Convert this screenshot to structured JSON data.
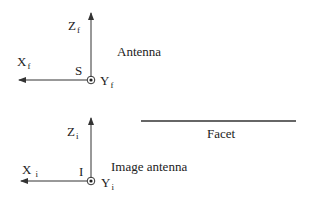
{
  "antenna": {
    "label": "Antenna",
    "origin_label": "S",
    "axes": {
      "z": {
        "main": "Z",
        "sub": "f"
      },
      "x": {
        "main": "X",
        "sub": "f"
      },
      "y": {
        "main": "Y",
        "sub": "f"
      }
    }
  },
  "image_antenna": {
    "label": "Image antenna",
    "origin_label": "I",
    "axes": {
      "z": {
        "main": "Z",
        "sub": "i"
      },
      "x": {
        "main": "X",
        "sub": "i"
      },
      "y": {
        "main": "Y",
        "sub": "i"
      }
    }
  },
  "facet": {
    "label": "Facet"
  },
  "colors": {
    "line": "#333333",
    "text": "#222222"
  }
}
